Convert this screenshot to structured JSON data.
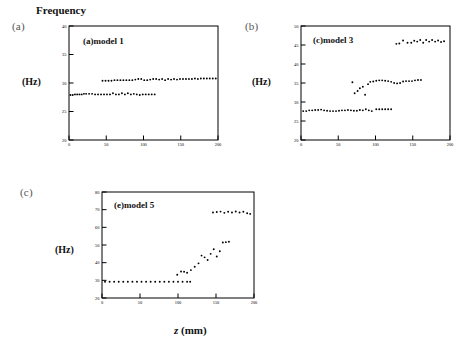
{
  "figure": {
    "title": "Frequency",
    "xaxis_label_var": "z",
    "xaxis_label_unit": "(mm)",
    "yaxis_unit": "(Hz)"
  },
  "panels": [
    {
      "letter": "(a)",
      "title": "(a)model 1",
      "chart_data": {
        "type": "scatter",
        "title": "(a)model 1",
        "xlabel": "z (mm)",
        "ylabel": "Frequency (Hz)",
        "xlim": [
          0,
          200
        ],
        "ylim": [
          20,
          40
        ],
        "xticks": [
          0,
          50,
          100,
          150,
          200
        ],
        "yticks": [
          20,
          25,
          30,
          35,
          40
        ],
        "grid": false,
        "legend": "none",
        "series": [
          {
            "name": "lower branch",
            "x": [
              2,
              5,
              8,
              11,
              14,
              17,
              20,
              23,
              27,
              31,
              35,
              39,
              43,
              47,
              51,
              55,
              59,
              63,
              67,
              71,
              75,
              79,
              83,
              87,
              91,
              95,
              99,
              103,
              107,
              111,
              115
            ],
            "y": [
              27.9,
              27.9,
              28.0,
              28.0,
              28.0,
              28.0,
              28.1,
              28.1,
              28.1,
              28.1,
              28.0,
              28.0,
              28.0,
              28.0,
              28.0,
              28.0,
              28.2,
              28.0,
              28.0,
              28.2,
              28.0,
              28.2,
              28.0,
              28.1,
              28.0,
              27.9,
              28.0,
              28.0,
              28.0,
              28.0,
              28.0
            ]
          },
          {
            "name": "upper branch",
            "x": [
              45,
              49,
              53,
              57,
              61,
              65,
              69,
              73,
              77,
              81,
              85,
              89,
              93,
              97,
              101,
              105,
              109,
              113,
              117,
              121,
              125,
              129,
              133,
              137,
              141,
              145,
              149,
              153,
              157,
              161,
              165,
              169,
              173,
              177,
              181,
              185,
              189,
              193,
              197
            ],
            "y": [
              30.4,
              30.4,
              30.4,
              30.4,
              30.5,
              30.5,
              30.5,
              30.5,
              30.5,
              30.5,
              30.5,
              30.6,
              30.7,
              30.7,
              30.5,
              30.5,
              30.6,
              30.7,
              30.7,
              30.6,
              30.7,
              30.5,
              30.7,
              30.6,
              30.7,
              30.6,
              30.7,
              30.7,
              30.7,
              30.7,
              30.7,
              30.8,
              30.7,
              30.8,
              30.8,
              30.8,
              30.8,
              30.8,
              30.8
            ]
          }
        ]
      }
    },
    {
      "letter": "(b)",
      "title": "(c)model 3",
      "chart_data": {
        "type": "scatter",
        "title": "(c)model 3",
        "xlabel": "z (mm)",
        "ylabel": "Frequency (Hz)",
        "xlim": [
          0,
          200
        ],
        "ylim": [
          20,
          50
        ],
        "xticks": [
          0,
          50,
          100,
          150,
          200
        ],
        "yticks": [
          20,
          25,
          30,
          35,
          40,
          45,
          50
        ],
        "grid": false,
        "legend": "none",
        "series": [
          {
            "name": "lower branch",
            "x": [
              3,
              7,
              11,
              15,
              19,
              23,
              27,
              31,
              35,
              39,
              43,
              47,
              51,
              55,
              59,
              63,
              67,
              71,
              75,
              79,
              83,
              87,
              91,
              95,
              101,
              105,
              109,
              113,
              117,
              121
            ],
            "y": [
              27.6,
              27.6,
              27.8,
              27.8,
              27.9,
              27.9,
              28.0,
              27.8,
              27.7,
              27.6,
              27.6,
              27.6,
              27.7,
              27.8,
              27.8,
              27.9,
              27.8,
              27.7,
              27.7,
              27.9,
              27.8,
              28.1,
              27.8,
              27.6,
              28.1,
              28.1,
              28.1,
              28.1,
              28.1,
              28.1
            ]
          },
          {
            "name": "middle branch",
            "x": [
              69,
              72,
              76,
              79,
              83,
              86,
              90,
              93,
              97,
              101,
              105,
              109,
              113,
              117,
              121,
              125,
              129,
              133,
              137,
              141,
              145,
              149,
              153,
              157,
              161
            ],
            "y": [
              35.2,
              32.3,
              32.9,
              33.6,
              34.0,
              31.9,
              34.7,
              35.3,
              35.4,
              35.6,
              35.7,
              35.7,
              35.6,
              35.5,
              35.3,
              35.0,
              34.9,
              35.0,
              35.4,
              35.5,
              35.5,
              35.5,
              35.7,
              35.8,
              35.8
            ]
          },
          {
            "name": "upper branch",
            "x": [
              128,
              132,
              137,
              143,
              148,
              152,
              156,
              160,
              164,
              168,
              172,
              176,
              180,
              184,
              188,
              192
            ],
            "y": [
              45.3,
              45.4,
              46.2,
              45.6,
              45.6,
              46.1,
              45.9,
              46.3,
              45.6,
              46.3,
              45.9,
              46.3,
              45.9,
              46.2,
              45.8,
              46.0
            ]
          }
        ]
      }
    },
    {
      "letter": "(c)",
      "title": "(e)model 5",
      "chart_data": {
        "type": "scatter",
        "title": "(e)model 5",
        "xlabel": "z (mm)",
        "ylabel": "Frequency (Hz)",
        "xlim": [
          0,
          200
        ],
        "ylim": [
          20,
          80
        ],
        "xticks": [
          0,
          50,
          100,
          150,
          200
        ],
        "yticks": [
          20,
          30,
          40,
          50,
          60,
          70,
          80
        ],
        "grid": false,
        "legend": "none",
        "series": [
          {
            "name": "flat baseline",
            "x": [
              4,
              10,
              16,
              22,
              28,
              34,
              40,
              46,
              52,
              58,
              64,
              70,
              76,
              82,
              88,
              94,
              100,
              106,
              112,
              116
            ],
            "y": [
              29.2,
              29.2,
              29.2,
              29.2,
              29.2,
              29.2,
              29.2,
              29.2,
              29.2,
              29.2,
              29.2,
              29.2,
              29.2,
              29.2,
              29.2,
              29.2,
              29.2,
              29.2,
              29.2,
              29.2
            ]
          },
          {
            "name": "rising branch",
            "x": [
              99,
              104,
              108,
              112,
              117,
              122,
              127,
              131,
              135,
              139,
              143,
              147,
              151,
              155,
              159,
              163,
              167
            ],
            "y": [
              33.2,
              35.0,
              34.9,
              34.3,
              35.8,
              37.7,
              39.6,
              44.0,
              43.0,
              41.5,
              45.0,
              47.6,
              43.5,
              46.5,
              51.4,
              51.6,
              51.8
            ]
          },
          {
            "name": "upper branch",
            "x": [
              146,
              151,
              156,
              161,
              166,
              171,
              176,
              181,
              186,
              191,
              195
            ],
            "y": [
              68.4,
              68.7,
              68.9,
              68.2,
              68.8,
              68.4,
              69.0,
              68.4,
              68.8,
              68.0,
              67.6
            ]
          }
        ]
      }
    }
  ]
}
